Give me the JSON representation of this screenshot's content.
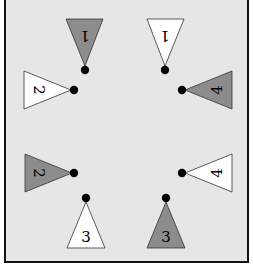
{
  "diagram": {
    "background": "#e6e6e6",
    "frame_color": "#111111",
    "gray_fill": "#8c8c8c",
    "white_fill": "#ffffff",
    "dot_color": "#000000",
    "markers": [
      {
        "id": "top-left-1",
        "label": "1",
        "fill": "gray",
        "direction": "down",
        "label_rotated": true
      },
      {
        "id": "top-right-1",
        "label": "1",
        "fill": "white",
        "direction": "down",
        "label_rotated": true
      },
      {
        "id": "left-upper-2",
        "label": "2",
        "fill": "white",
        "direction": "right",
        "label_rotated": true
      },
      {
        "id": "right-upper-4",
        "label": "4",
        "fill": "gray",
        "direction": "left",
        "label_rotated": true
      },
      {
        "id": "left-lower-2",
        "label": "2",
        "fill": "gray",
        "direction": "right",
        "label_rotated": true
      },
      {
        "id": "right-lower-4",
        "label": "4",
        "fill": "white",
        "direction": "left",
        "label_rotated": true
      },
      {
        "id": "bottom-left-3",
        "label": "3",
        "fill": "white",
        "direction": "up",
        "label_rotated": false
      },
      {
        "id": "bottom-right-3",
        "label": "3",
        "fill": "gray",
        "direction": "up",
        "label_rotated": false
      }
    ]
  }
}
